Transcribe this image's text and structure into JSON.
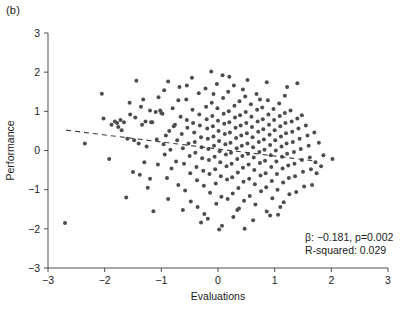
{
  "panel": {
    "label": "(b)"
  },
  "colors": {
    "point": "#4d4d4d",
    "axis": "#4d4d4d",
    "text": "#1a1a1a",
    "trendline": "#3d3d3d",
    "background": "#ffffff"
  },
  "annotation": {
    "line1_beta_symbol": "β",
    "line1": "β: −0.181, p=0.002",
    "line2": "R-squared: 0.029",
    "beta": -0.181,
    "p_value": 0.002,
    "r_squared": 0.029
  },
  "chart_data": {
    "type": "scatter",
    "title": "",
    "xlabel": "Evaluations",
    "ylabel": "Performance",
    "xlim": [
      -3,
      3
    ],
    "ylim": [
      -3,
      3
    ],
    "xticks": [
      -3,
      -2,
      -1,
      0,
      1,
      2,
      3
    ],
    "yticks": [
      -3,
      -2,
      -1,
      0,
      1,
      2,
      3
    ],
    "xtick_labels": [
      "−3",
      "−2",
      "−1",
      "0",
      "1",
      "2",
      "3"
    ],
    "ytick_labels": [
      "−3",
      "−2",
      "−1",
      "0",
      "1",
      "2",
      "3"
    ],
    "grid": false,
    "legend": false,
    "marker": "circle",
    "marker_size": 4,
    "n_points": 265,
    "trendline": {
      "type": "linear-dashed",
      "slope": -0.181,
      "intercept": 0.04,
      "x_start": -2.68,
      "x_end": 1.72,
      "y_start": 0.52,
      "y_end": -0.27
    },
    "points": [
      [
        -2.7,
        -1.85
      ],
      [
        -2.05,
        1.45
      ],
      [
        -2.02,
        0.82
      ],
      [
        -1.92,
        -0.22
      ],
      [
        -1.88,
        0.66
      ],
      [
        -1.82,
        0.74
      ],
      [
        -1.78,
        0.7
      ],
      [
        -1.76,
        0.6
      ],
      [
        -1.72,
        0.78
      ],
      [
        -1.7,
        0.52
      ],
      [
        -1.66,
        0.72
      ],
      [
        -1.62,
        -1.2
      ],
      [
        -1.6,
        0.3
      ],
      [
        -1.56,
        1.22
      ],
      [
        -1.5,
        -0.55
      ],
      [
        -1.46,
        0.84
      ],
      [
        -1.44,
        1.78
      ],
      [
        -1.4,
        0.18
      ],
      [
        -1.38,
        -0.62
      ],
      [
        -1.34,
        0.66
      ],
      [
        -1.32,
        1.3
      ],
      [
        -1.28,
        0.74
      ],
      [
        -1.26,
        0.1
      ],
      [
        -1.24,
        -0.95
      ],
      [
        -1.2,
        1.02
      ],
      [
        -1.18,
        0.72
      ],
      [
        -1.16,
        0.72
      ],
      [
        -1.14,
        -1.55
      ],
      [
        -1.1,
        0.98
      ],
      [
        -1.08,
        0.28
      ],
      [
        -1.06,
        -0.36
      ],
      [
        -1.02,
        1.02
      ],
      [
        -1.0,
        0.96
      ],
      [
        -0.98,
        0.94
      ],
      [
        -0.96,
        0.16
      ],
      [
        -0.94,
        -0.1
      ],
      [
        -0.92,
        0.38
      ],
      [
        -0.9,
        -0.7
      ],
      [
        -0.88,
        1.76
      ],
      [
        -0.86,
        0.5
      ],
      [
        -0.84,
        0.02
      ],
      [
        -0.82,
        -0.46
      ],
      [
        -0.8,
        1.08
      ],
      [
        -0.78,
        0.62
      ],
      [
        -0.76,
        0.66
      ],
      [
        -0.74,
        -0.28
      ],
      [
        -0.72,
        0.26
      ],
      [
        -0.7,
        -0.88
      ],
      [
        -0.68,
        1.62
      ],
      [
        -0.66,
        0.86
      ],
      [
        -0.64,
        0.42
      ],
      [
        -0.62,
        0.06
      ],
      [
        -0.6,
        -0.34
      ],
      [
        -0.58,
        -1.02
      ],
      [
        -0.56,
        1.3
      ],
      [
        -0.55,
        0.78
      ],
      [
        -0.54,
        0.58
      ],
      [
        -0.52,
        0.18
      ],
      [
        -0.5,
        -0.14
      ],
      [
        -0.49,
        -0.58
      ],
      [
        -0.48,
        -1.3
      ],
      [
        -0.46,
        1.86
      ],
      [
        -0.45,
        1.04
      ],
      [
        -0.44,
        0.7
      ],
      [
        -0.42,
        0.46
      ],
      [
        -0.41,
        0.22
      ],
      [
        -0.4,
        -0.06
      ],
      [
        -0.38,
        -0.42
      ],
      [
        -0.37,
        -0.76
      ],
      [
        -0.36,
        -1.44
      ],
      [
        -0.34,
        1.46
      ],
      [
        -0.33,
        0.92
      ],
      [
        -0.32,
        0.64
      ],
      [
        -0.3,
        0.34
      ],
      [
        -0.29,
        0.08
      ],
      [
        -0.28,
        -0.2
      ],
      [
        -0.26,
        -0.52
      ],
      [
        -0.25,
        -0.9
      ],
      [
        -0.24,
        -1.62
      ],
      [
        -0.22,
        1.58
      ],
      [
        -0.21,
        1.12
      ],
      [
        -0.2,
        0.8
      ],
      [
        -0.19,
        0.56
      ],
      [
        -0.18,
        0.3
      ],
      [
        -0.17,
        0.04
      ],
      [
        -0.16,
        -0.24
      ],
      [
        -0.15,
        -0.6
      ],
      [
        -0.14,
        -1.08
      ],
      [
        -0.12,
        2.02
      ],
      [
        -0.11,
        1.22
      ],
      [
        -0.1,
        0.88
      ],
      [
        -0.09,
        0.62
      ],
      [
        -0.08,
        0.36
      ],
      [
        -0.07,
        0.12
      ],
      [
        -0.06,
        -0.16
      ],
      [
        -0.05,
        -0.48
      ],
      [
        -0.04,
        -0.84
      ],
      [
        -0.03,
        -1.36
      ],
      [
        -0.02,
        1.7
      ],
      [
        -0.01,
        1.08
      ],
      [
        0.0,
        0.76
      ],
      [
        0.01,
        0.5
      ],
      [
        0.02,
        0.24
      ],
      [
        0.03,
        -0.02
      ],
      [
        0.04,
        -0.3
      ],
      [
        0.05,
        -0.66
      ],
      [
        0.06,
        -1.18
      ],
      [
        0.07,
        -1.92
      ],
      [
        0.08,
        1.92
      ],
      [
        0.09,
        1.34
      ],
      [
        0.1,
        0.94
      ],
      [
        0.11,
        0.68
      ],
      [
        0.12,
        0.42
      ],
      [
        0.13,
        0.16
      ],
      [
        0.14,
        -0.1
      ],
      [
        0.15,
        -0.4
      ],
      [
        0.16,
        -0.74
      ],
      [
        0.17,
        -1.24
      ],
      [
        0.18,
        1.5
      ],
      [
        0.19,
        1.0
      ],
      [
        0.2,
        0.72
      ],
      [
        0.21,
        0.46
      ],
      [
        0.22,
        0.2
      ],
      [
        0.23,
        -0.06
      ],
      [
        0.24,
        -0.34
      ],
      [
        0.25,
        -0.68
      ],
      [
        0.26,
        -1.1
      ],
      [
        0.27,
        -1.7
      ],
      [
        0.28,
        1.66
      ],
      [
        0.29,
        1.14
      ],
      [
        0.3,
        0.84
      ],
      [
        0.31,
        0.58
      ],
      [
        0.32,
        0.32
      ],
      [
        0.33,
        0.06
      ],
      [
        0.34,
        -0.22
      ],
      [
        0.35,
        -0.56
      ],
      [
        0.36,
        -0.96
      ],
      [
        0.37,
        -1.48
      ],
      [
        0.38,
        1.26
      ],
      [
        0.39,
        0.9
      ],
      [
        0.4,
        0.64
      ],
      [
        0.41,
        0.38
      ],
      [
        0.42,
        0.12
      ],
      [
        0.43,
        -0.14
      ],
      [
        0.44,
        -0.44
      ],
      [
        0.45,
        -0.8
      ],
      [
        0.46,
        -1.28
      ],
      [
        0.47,
        -2.0
      ],
      [
        0.48,
        1.38
      ],
      [
        0.49,
        0.98
      ],
      [
        0.5,
        0.7
      ],
      [
        0.51,
        0.44
      ],
      [
        0.52,
        0.18
      ],
      [
        0.53,
        -0.08
      ],
      [
        0.54,
        -0.36
      ],
      [
        0.55,
        -0.72
      ],
      [
        0.56,
        -1.16
      ],
      [
        0.58,
        1.18
      ],
      [
        0.59,
        0.86
      ],
      [
        0.6,
        0.6
      ],
      [
        0.61,
        0.34
      ],
      [
        0.62,
        0.08
      ],
      [
        0.63,
        -0.18
      ],
      [
        0.64,
        -0.5
      ],
      [
        0.65,
        -0.86
      ],
      [
        0.66,
        -1.38
      ],
      [
        0.68,
        1.44
      ],
      [
        0.69,
        1.04
      ],
      [
        0.7,
        0.74
      ],
      [
        0.71,
        0.48
      ],
      [
        0.72,
        0.22
      ],
      [
        0.73,
        -0.04
      ],
      [
        0.74,
        -0.32
      ],
      [
        0.75,
        -0.64
      ],
      [
        0.76,
        -1.04
      ],
      [
        0.78,
        1.1
      ],
      [
        0.79,
        0.8
      ],
      [
        0.8,
        0.54
      ],
      [
        0.81,
        0.28
      ],
      [
        0.82,
        0.02
      ],
      [
        0.83,
        -0.26
      ],
      [
        0.84,
        -0.58
      ],
      [
        0.85,
        -0.94
      ],
      [
        0.86,
        -1.56
      ],
      [
        0.88,
        1.28
      ],
      [
        0.89,
        0.92
      ],
      [
        0.9,
        0.66
      ],
      [
        0.91,
        0.4
      ],
      [
        0.92,
        0.14
      ],
      [
        0.93,
        -0.12
      ],
      [
        0.94,
        -0.42
      ],
      [
        0.95,
        -0.78
      ],
      [
        0.96,
        -1.22
      ],
      [
        0.98,
        1.06
      ],
      [
        0.99,
        0.78
      ],
      [
        1.0,
        0.52
      ],
      [
        1.01,
        0.26
      ],
      [
        1.02,
        0.0
      ],
      [
        1.03,
        -0.28
      ],
      [
        1.04,
        -0.6
      ],
      [
        1.05,
        -1.0
      ],
      [
        1.06,
        -1.64
      ],
      [
        1.08,
        1.2
      ],
      [
        1.09,
        0.88
      ],
      [
        1.1,
        0.62
      ],
      [
        1.11,
        0.36
      ],
      [
        1.12,
        0.1
      ],
      [
        1.13,
        -0.16
      ],
      [
        1.14,
        -0.46
      ],
      [
        1.15,
        -0.82
      ],
      [
        1.16,
        -1.32
      ],
      [
        1.18,
        0.96
      ],
      [
        1.19,
        0.7
      ],
      [
        1.2,
        0.44
      ],
      [
        1.21,
        0.18
      ],
      [
        1.22,
        -0.08
      ],
      [
        1.24,
        -0.38
      ],
      [
        1.25,
        -0.7
      ],
      [
        1.26,
        -1.12
      ],
      [
        1.28,
        1.02
      ],
      [
        1.3,
        0.74
      ],
      [
        1.31,
        0.48
      ],
      [
        1.32,
        0.22
      ],
      [
        1.34,
        -0.04
      ],
      [
        1.35,
        -0.34
      ],
      [
        1.36,
        -0.66
      ],
      [
        1.38,
        -1.06
      ],
      [
        1.4,
        0.82
      ],
      [
        1.42,
        0.56
      ],
      [
        1.44,
        0.3
      ],
      [
        1.46,
        0.04
      ],
      [
        1.48,
        -0.24
      ],
      [
        1.5,
        -0.54
      ],
      [
        1.52,
        -0.92
      ],
      [
        1.55,
        0.64
      ],
      [
        1.58,
        0.38
      ],
      [
        1.6,
        0.12
      ],
      [
        1.62,
        -0.18
      ],
      [
        1.64,
        -0.48
      ],
      [
        1.66,
        -0.88
      ],
      [
        1.7,
        0.46
      ],
      [
        1.72,
        -0.3
      ],
      [
        1.74,
        -0.58
      ],
      [
        1.78,
        0.2
      ],
      [
        1.82,
        -0.4
      ],
      [
        1.86,
        -0.12
      ],
      [
        1.4,
        1.72
      ],
      [
        1.22,
        1.62
      ],
      [
        0.86,
        1.74
      ],
      [
        0.52,
        1.8
      ],
      [
        0.2,
        1.88
      ],
      [
        -0.55,
        1.66
      ],
      [
        -0.7,
        1.28
      ],
      [
        -1.05,
        1.36
      ],
      [
        -0.3,
        -1.84
      ],
      [
        0.62,
        -1.78
      ],
      [
        -0.88,
        -1.24
      ],
      [
        -1.3,
        -0.3
      ],
      [
        -1.55,
        0.92
      ],
      [
        -1.48,
        0.26
      ],
      [
        -0.95,
        1.54
      ],
      [
        0.34,
        -1.52
      ],
      [
        1.1,
        -1.44
      ],
      [
        -0.18,
        -1.74
      ],
      [
        1.18,
        1.4
      ],
      [
        0.02,
        -2.02
      ],
      [
        -1.2,
        -0.72
      ],
      [
        -1.36,
        1.12
      ],
      [
        2.02,
        -0.22
      ],
      [
        -0.62,
        -1.52
      ],
      [
        0.44,
        1.56
      ],
      [
        -0.08,
        1.44
      ],
      [
        0.74,
        1.3
      ],
      [
        1.48,
        0.9
      ],
      [
        -2.35,
        0.18
      ],
      [
        0.92,
        -1.66
      ]
    ]
  }
}
